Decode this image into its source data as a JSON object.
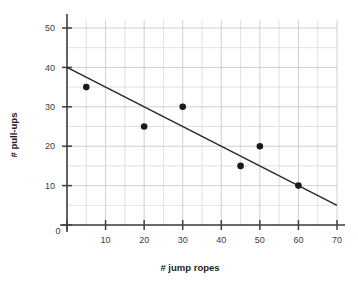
{
  "chart_data": {
    "type": "scatter",
    "title": "",
    "xlabel": "# jump ropes",
    "ylabel": "# pull-ups",
    "xlim": [
      0,
      70
    ],
    "ylim": [
      0,
      52
    ],
    "grid": true,
    "legend": "none",
    "x_ticks": [
      0,
      10,
      20,
      30,
      40,
      50,
      60,
      70
    ],
    "x_tick_labels": [
      "0",
      "10",
      "20",
      "30",
      "40",
      "50",
      "60",
      "70"
    ],
    "y_ticks": [
      0,
      10,
      20,
      30,
      40,
      50
    ],
    "y_tick_labels": [
      "0",
      "10",
      "20",
      "30",
      "40",
      "50"
    ],
    "grid_step_x": 5,
    "grid_step_y": 5,
    "series": [
      {
        "name": "data points",
        "type": "scatter",
        "marker": "filled-circle",
        "color": "#1a1a1a",
        "points": [
          {
            "x": 5,
            "y": 35
          },
          {
            "x": 20,
            "y": 25
          },
          {
            "x": 30,
            "y": 30
          },
          {
            "x": 45,
            "y": 15
          },
          {
            "x": 50,
            "y": 20
          },
          {
            "x": 60,
            "y": 10
          }
        ]
      },
      {
        "name": "trend line",
        "type": "line",
        "color": "#2a2a2a",
        "endpoints": [
          {
            "x": 0,
            "y": 40
          },
          {
            "x": 70,
            "y": 5
          }
        ],
        "slope": -0.5,
        "intercept": 40
      }
    ],
    "colors": {
      "background": "#ffffff",
      "grid": "#d9d9dd",
      "axis": "#404040",
      "point": "#1a1a1a",
      "line": "#2a2a2a",
      "tick_label": "#3c3c3c",
      "axis_title": "#1e1e1e"
    }
  }
}
